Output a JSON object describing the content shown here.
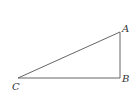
{
  "diagram": {
    "type": "right-triangle",
    "vertices": [
      {
        "label": "A",
        "x": 120,
        "y": 32
      },
      {
        "label": "B",
        "x": 120,
        "y": 78
      },
      {
        "label": "C",
        "x": 18,
        "y": 78
      }
    ],
    "edges": [
      [
        "C",
        "A"
      ],
      [
        "A",
        "B"
      ],
      [
        "B",
        "C"
      ]
    ],
    "right_angle_at": "B",
    "stroke_color": "#555555",
    "label_color": "#333333"
  },
  "labels": {
    "a": "A",
    "b": "B",
    "c": "C"
  }
}
